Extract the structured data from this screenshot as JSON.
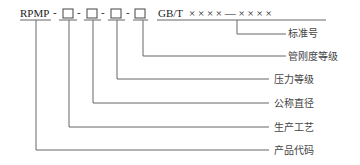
{
  "diagram": {
    "prefix": "RPMP",
    "separator": "-",
    "placeholder_count": 4,
    "standard": "GB/T",
    "standard_number": "× × × × — × × × ×",
    "labels": [
      {
        "key": "standard_number",
        "text": "标准号"
      },
      {
        "key": "stiffness_class",
        "text": "管刚度等级"
      },
      {
        "key": "pressure_class",
        "text": "压力等级"
      },
      {
        "key": "nominal_diameter",
        "text": "公称直径"
      },
      {
        "key": "production_process",
        "text": "生产工艺"
      },
      {
        "key": "product_code",
        "text": "产品代码"
      }
    ]
  }
}
